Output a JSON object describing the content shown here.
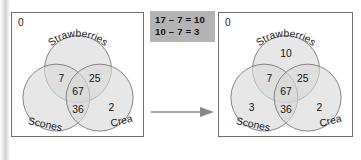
{
  "diagram": {
    "type": "venn-transformation",
    "title_visible": false,
    "arrow": {
      "name": "right-arrow",
      "direction": "right"
    },
    "formula_box": {
      "lines": [
        "17 – 7 = 10",
        "10 – 7 = 3"
      ],
      "bg_color": "#b3b3b3",
      "text_color": "#111111"
    },
    "colors": {
      "circle_fill": "#d9d9d9",
      "circle_stroke": "#777777",
      "box_stroke": "#6e6e6e",
      "text": "#1a1a1a",
      "background": "#ffffff"
    },
    "left": {
      "name": "venn-before",
      "universe_label": "0",
      "set_labels": {
        "top": "Strawberries",
        "bottom_left": "Scones",
        "bottom_right": "Cream"
      },
      "regions": [
        {
          "key": "strawberries_only",
          "value": ""
        },
        {
          "key": "strawberries_scones",
          "value": "7"
        },
        {
          "key": "strawberries_cream",
          "value": "25"
        },
        {
          "key": "all_three",
          "value": "67"
        },
        {
          "key": "scones_cream",
          "value": "36"
        },
        {
          "key": "scones_only",
          "value": ""
        },
        {
          "key": "cream_only",
          "value": "2"
        }
      ]
    },
    "right": {
      "name": "venn-after",
      "universe_label": "0",
      "set_labels": {
        "top": "Strawberries",
        "bottom_left": "Scones",
        "bottom_right": "Cream"
      },
      "regions": [
        {
          "key": "strawberries_only",
          "value": "10"
        },
        {
          "key": "strawberries_scones",
          "value": "7"
        },
        {
          "key": "strawberries_cream",
          "value": "25"
        },
        {
          "key": "all_three",
          "value": "67"
        },
        {
          "key": "scones_cream",
          "value": "36"
        },
        {
          "key": "scones_only",
          "value": "3"
        },
        {
          "key": "cream_only",
          "value": "2"
        }
      ]
    }
  }
}
